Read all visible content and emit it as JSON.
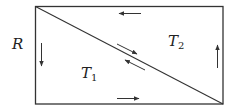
{
  "diagram": {
    "region_label": "R",
    "triangles": [
      {
        "name": "T",
        "subscript": "1"
      },
      {
        "name": "T",
        "subscript": "2"
      }
    ],
    "stroke_color": "#333333",
    "arrows": {
      "top": "left",
      "bottom": "right",
      "left": "down",
      "right": "up",
      "diagonal_upper": "down-right",
      "diagonal_lower": "up-left"
    }
  }
}
